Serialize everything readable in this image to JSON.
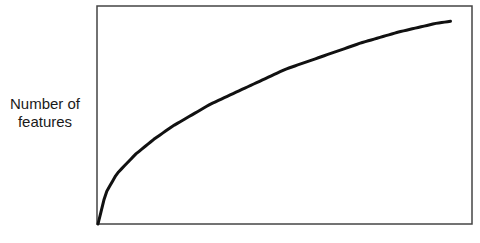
{
  "chart_data": {
    "type": "line",
    "title": "",
    "xlabel": "",
    "ylabel": "Number of features",
    "ylabel_lines": [
      "Number of",
      "features"
    ],
    "grid": false,
    "legend": null,
    "x_ticks": [],
    "y_ticks": [],
    "xlim": [
      0,
      1
    ],
    "ylim": [
      0,
      1
    ],
    "series": [
      {
        "name": "features",
        "color": "#111111",
        "x": [
          0,
          0.02,
          0.05,
          0.1,
          0.15,
          0.2,
          0.3,
          0.4,
          0.5,
          0.6,
          0.7,
          0.8,
          0.9,
          0.94
        ],
        "y": [
          0,
          0.14,
          0.23,
          0.32,
          0.39,
          0.45,
          0.55,
          0.63,
          0.71,
          0.77,
          0.83,
          0.88,
          0.92,
          0.93
        ]
      }
    ]
  },
  "frame": {
    "left": 97,
    "top": 6,
    "right": 472,
    "bottom": 224,
    "color": "#444444"
  }
}
